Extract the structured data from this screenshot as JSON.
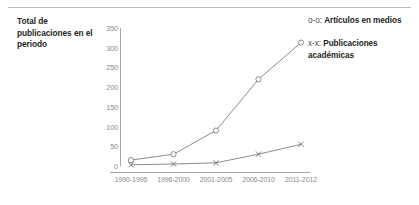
{
  "axis_title": "Total de publicaciones en el periodo",
  "legend": {
    "items": [
      {
        "key": "o-o:",
        "label": "Artículos en medios",
        "marker": "circle-marker-icon"
      },
      {
        "key": "x-x:",
        "label": "Publicaciones académicas",
        "marker": "cross-marker-icon"
      }
    ]
  },
  "colors": {
    "axis": "#a6a6a6",
    "tick_text": "#8a8a8a",
    "series_line": "#6e6e6e",
    "title_text": "#231f20",
    "rule": "#b9b9b9"
  },
  "chart_data": {
    "type": "line",
    "title": "",
    "xlabel": "",
    "ylabel": "Total de publicaciones en el periodo",
    "categories": [
      "1990-1995",
      "1996-2000",
      "2001-2005",
      "2006-2010",
      "2011-2012"
    ],
    "yticks": [
      0,
      50,
      100,
      150,
      200,
      250,
      300,
      350
    ],
    "ylim": [
      0,
      350
    ],
    "grid": false,
    "legend_position": "right",
    "series": [
      {
        "name": "Artículos en medios",
        "marker": "o",
        "values": [
          15,
          30,
          90,
          220,
          313
        ]
      },
      {
        "name": "Publicaciones académicas",
        "marker": "x",
        "values": [
          3,
          5,
          8,
          30,
          55
        ]
      }
    ]
  }
}
